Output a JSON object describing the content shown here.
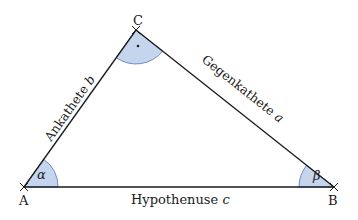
{
  "diagram": {
    "colors": {
      "line": "#1a1a1a",
      "angle_fill": "#c5d5ee",
      "angle_stroke": "#6f8fc4"
    },
    "vertices": {
      "A": {
        "label": "A"
      },
      "B": {
        "label": "B"
      },
      "C": {
        "label": "C"
      }
    },
    "sides": {
      "b": {
        "text": "Ankathete ",
        "var": "b"
      },
      "a": {
        "text": "Gegenkathete ",
        "var": "a"
      },
      "c": {
        "text": "Hypothenuse ",
        "var": "c"
      }
    },
    "angles": {
      "alpha": "α",
      "beta": "β",
      "right_angle_mark": "·"
    }
  }
}
